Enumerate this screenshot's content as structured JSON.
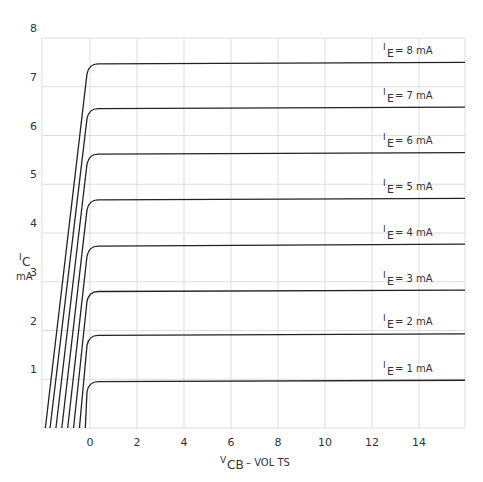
{
  "chart_data": {
    "type": "line",
    "title": "",
    "xlabel": "V_CB - VOLTS",
    "ylabel": "I_C mA",
    "x_ticks": [
      0,
      2,
      4,
      6,
      8,
      10,
      12,
      14
    ],
    "y_ticks": [
      1,
      2,
      3,
      4,
      5,
      6,
      7,
      8
    ],
    "xlim": [
      -2,
      16
    ],
    "ylim": [
      0,
      8
    ],
    "grid": true,
    "legend_position": "inline-right",
    "series": [
      {
        "name": "I_E = 1 mA",
        "saturation_mA": 0.95,
        "knee_V": 0.3,
        "x_at_zero_current": -0.2,
        "end_mA": 0.98
      },
      {
        "name": "I_E = 2 mA",
        "saturation_mA": 1.9,
        "knee_V": 0.3,
        "x_at_zero_current": -0.45,
        "end_mA": 1.93
      },
      {
        "name": "I_E = 3 mA",
        "saturation_mA": 2.8,
        "knee_V": 0.3,
        "x_at_zero_current": -0.7,
        "end_mA": 2.83
      },
      {
        "name": "I_E = 4 mA",
        "saturation_mA": 3.73,
        "knee_V": 0.3,
        "x_at_zero_current": -0.95,
        "end_mA": 3.77
      },
      {
        "name": "I_E = 5 mA",
        "saturation_mA": 4.68,
        "knee_V": 0.3,
        "x_at_zero_current": -1.2,
        "end_mA": 4.71
      },
      {
        "name": "I_E = 6 mA",
        "saturation_mA": 5.62,
        "knee_V": 0.3,
        "x_at_zero_current": -1.45,
        "end_mA": 5.65
      },
      {
        "name": "I_E = 7 mA",
        "saturation_mA": 6.55,
        "knee_V": 0.3,
        "x_at_zero_current": -1.7,
        "end_mA": 6.58
      },
      {
        "name": "I_E = 8 mA",
        "saturation_mA": 7.47,
        "knee_V": 0.3,
        "x_at_zero_current": -1.9,
        "end_mA": 7.5
      }
    ]
  },
  "axes": {
    "y_unit_top": "I",
    "y_unit_sub": "C",
    "y_unit_bottom": "mA",
    "x_label_main": "V",
    "x_label_sub": "CB",
    "x_label_rest": " –  VOL TS"
  },
  "labels": [
    {
      "main": "I",
      "sub": "E",
      "rest": " = 1 mA"
    },
    {
      "main": "I",
      "sub": "E",
      "rest": " = 2 mA"
    },
    {
      "main": "I",
      "sub": "E",
      "rest": " = 3 mA"
    },
    {
      "main": "I",
      "sub": "E",
      "rest": " = 4 mA"
    },
    {
      "main": "I",
      "sub": "E",
      "rest": " = 5 mA"
    },
    {
      "main": "I",
      "sub": "E",
      "rest": " = 6 mA"
    },
    {
      "main": "I",
      "sub": "E",
      "rest": " = 7 mA"
    },
    {
      "main": "I",
      "sub": "E",
      "rest": " = 8 mA"
    }
  ]
}
